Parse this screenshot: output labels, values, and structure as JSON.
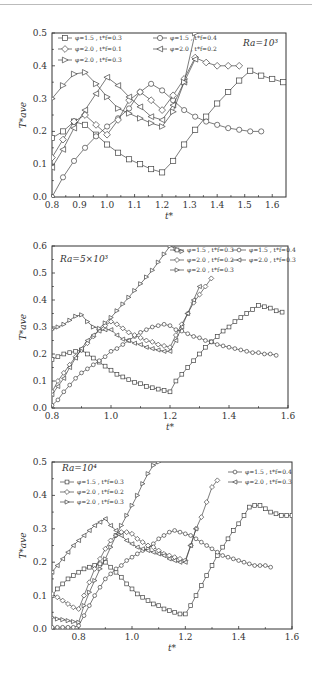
{
  "chart_data": [
    {
      "type": "line",
      "title": "",
      "annotation": "Ra=10³",
      "xlabel": "t*",
      "ylabel": "T*ave",
      "xlim": [
        0.8,
        1.65
      ],
      "ylim": [
        0.0,
        0.5
      ],
      "xticks": [
        0.8,
        0.9,
        1.0,
        1.1,
        1.2,
        1.3,
        1.4,
        1.5,
        1.6
      ],
      "yticks": [
        0.0,
        0.1,
        0.2,
        0.3,
        0.4,
        0.5
      ],
      "legend_position": "upper-left",
      "series": [
        {
          "name": "φ=1.5 , t*f=0.3",
          "marker": "square",
          "x": [
            0.8,
            0.84,
            0.88,
            0.92,
            0.96,
            1.0,
            1.04,
            1.08,
            1.12,
            1.16,
            1.2,
            1.24,
            1.28,
            1.32,
            1.36,
            1.4,
            1.44,
            1.48,
            1.52,
            1.56,
            1.6,
            1.64
          ],
          "y": [
            0.18,
            0.2,
            0.23,
            0.22,
            0.19,
            0.16,
            0.135,
            0.115,
            0.1,
            0.085,
            0.075,
            0.11,
            0.16,
            0.205,
            0.245,
            0.285,
            0.32,
            0.355,
            0.385,
            0.37,
            0.36,
            0.35
          ]
        },
        {
          "name": "φ=1.5 , t*f=0.4",
          "marker": "circle",
          "x": [
            0.8,
            0.84,
            0.88,
            0.92,
            0.96,
            1.0,
            1.04,
            1.08,
            1.12,
            1.16,
            1.2,
            1.24,
            1.28,
            1.32,
            1.36,
            1.4,
            1.44,
            1.48,
            1.52,
            1.56
          ],
          "y": [
            0.0,
            0.06,
            0.11,
            0.15,
            0.185,
            0.215,
            0.24,
            0.27,
            0.32,
            0.345,
            0.325,
            0.295,
            0.265,
            0.245,
            0.23,
            0.22,
            0.21,
            0.205,
            0.2,
            0.2
          ]
        },
        {
          "name": "φ=2.0 , t*f=0.1",
          "marker": "diamond",
          "x": [
            0.8,
            0.84,
            0.88,
            0.92,
            0.96,
            1.0,
            1.04,
            1.08,
            1.12,
            1.16,
            1.2,
            1.24,
            1.28,
            1.32,
            1.36,
            1.4,
            1.44,
            1.48
          ],
          "y": [
            0.12,
            0.175,
            0.23,
            0.25,
            0.22,
            0.19,
            0.235,
            0.295,
            0.32,
            0.295,
            0.265,
            0.31,
            0.36,
            0.425,
            0.41,
            0.4,
            0.4,
            0.4
          ]
        },
        {
          "name": "φ=2.0 , t*f=0.2",
          "marker": "triangle-left",
          "x": [
            0.8,
            0.84,
            0.88,
            0.92,
            0.96,
            1.0,
            1.04,
            1.08,
            1.12,
            1.16,
            1.2,
            1.24,
            1.28,
            1.32
          ],
          "y": [
            0.09,
            0.145,
            0.21,
            0.265,
            0.315,
            0.365,
            0.34,
            0.305,
            0.275,
            0.245,
            0.235,
            0.28,
            0.35,
            0.42
          ]
        },
        {
          "name": "φ=2.0 , t*f=0.3",
          "marker": "triangle-right",
          "x": [
            0.8,
            0.84,
            0.88,
            0.92,
            0.96,
            1.0,
            1.04,
            1.08,
            1.12,
            1.16,
            1.2,
            1.24,
            1.28,
            1.32
          ],
          "y": [
            0.3,
            0.34,
            0.375,
            0.38,
            0.345,
            0.305,
            0.27,
            0.255,
            0.24,
            0.225,
            0.215,
            0.26,
            0.35,
            0.5
          ]
        }
      ]
    },
    {
      "type": "line",
      "title": "",
      "annotation": "Ra=5×10³",
      "xlabel": "t*",
      "ylabel": "T*ave",
      "xlim": [
        0.8,
        1.6
      ],
      "ylim": [
        0.0,
        0.6
      ],
      "xticks": [
        0.8,
        1.0,
        1.2,
        1.4,
        1.6
      ],
      "yticks": [
        0.0,
        0.1,
        0.2,
        0.3,
        0.4,
        0.5,
        0.6
      ],
      "legend_position": "upper-right",
      "series": [
        {
          "name": "φ=1.5 , t*f=0.3",
          "marker": "square",
          "x": [
            0.8,
            0.82,
            0.84,
            0.86,
            0.88,
            0.9,
            0.92,
            0.94,
            0.96,
            0.98,
            1.0,
            1.02,
            1.04,
            1.06,
            1.08,
            1.1,
            1.12,
            1.14,
            1.16,
            1.18,
            1.2,
            1.22,
            1.24,
            1.26,
            1.28,
            1.3,
            1.32,
            1.34,
            1.36,
            1.38,
            1.4,
            1.42,
            1.44,
            1.46,
            1.48,
            1.5,
            1.52,
            1.54,
            1.56,
            1.58
          ],
          "y": [
            0.18,
            0.19,
            0.2,
            0.205,
            0.21,
            0.215,
            0.2,
            0.185,
            0.17,
            0.155,
            0.14,
            0.125,
            0.115,
            0.105,
            0.095,
            0.09,
            0.08,
            0.075,
            0.07,
            0.065,
            0.06,
            0.1,
            0.125,
            0.15,
            0.175,
            0.2,
            0.225,
            0.245,
            0.265,
            0.285,
            0.3,
            0.32,
            0.335,
            0.35,
            0.365,
            0.38,
            0.375,
            0.37,
            0.36,
            0.355
          ]
        },
        {
          "name": "φ=1.5 , t*f=0.4",
          "marker": "circle",
          "x": [
            0.8,
            0.82,
            0.84,
            0.86,
            0.88,
            0.9,
            0.92,
            0.94,
            0.96,
            0.98,
            1.0,
            1.02,
            1.04,
            1.06,
            1.08,
            1.1,
            1.12,
            1.14,
            1.16,
            1.18,
            1.2,
            1.22,
            1.24,
            1.26,
            1.28,
            1.3,
            1.32,
            1.34,
            1.36,
            1.38,
            1.4,
            1.42,
            1.44,
            1.46,
            1.48,
            1.5,
            1.52,
            1.54,
            1.56
          ],
          "y": [
            0.01,
            0.03,
            0.06,
            0.085,
            0.11,
            0.13,
            0.145,
            0.16,
            0.175,
            0.19,
            0.21,
            0.22,
            0.235,
            0.25,
            0.265,
            0.28,
            0.29,
            0.3,
            0.305,
            0.31,
            0.305,
            0.29,
            0.285,
            0.275,
            0.265,
            0.26,
            0.25,
            0.245,
            0.235,
            0.23,
            0.225,
            0.22,
            0.215,
            0.21,
            0.205,
            0.205,
            0.2,
            0.2,
            0.195
          ]
        },
        {
          "name": "φ=2.0 , t*f=0.2",
          "marker": "diamond",
          "x": [
            0.8,
            0.82,
            0.84,
            0.86,
            0.88,
            0.9,
            0.92,
            0.94,
            0.96,
            0.98,
            1.0,
            1.02,
            1.04,
            1.06,
            1.08,
            1.1,
            1.12,
            1.14,
            1.16,
            1.18,
            1.2,
            1.22,
            1.24,
            1.26,
            1.28,
            1.3,
            1.32,
            1.34
          ],
          "y": [
            0.06,
            0.1,
            0.13,
            0.16,
            0.19,
            0.215,
            0.24,
            0.265,
            0.29,
            0.305,
            0.32,
            0.31,
            0.295,
            0.28,
            0.27,
            0.26,
            0.25,
            0.245,
            0.235,
            0.23,
            0.225,
            0.27,
            0.31,
            0.35,
            0.39,
            0.42,
            0.45,
            0.48
          ]
        },
        {
          "name": "φ=2.0 , t*f=0.3",
          "marker": "triangle-left",
          "x": [
            0.8,
            0.82,
            0.84,
            0.86,
            0.88,
            0.9,
            0.92,
            0.94,
            0.96,
            0.98,
            1.0,
            1.02,
            1.04,
            1.06,
            1.08,
            1.1,
            1.12,
            1.14,
            1.16,
            1.18,
            1.2,
            1.22,
            1.24,
            1.26,
            1.28,
            1.3
          ],
          "y": [
            0.05,
            0.08,
            0.11,
            0.15,
            0.185,
            0.22,
            0.25,
            0.27,
            0.285,
            0.29,
            0.29,
            0.27,
            0.255,
            0.25,
            0.24,
            0.235,
            0.225,
            0.22,
            0.215,
            0.21,
            0.21,
            0.25,
            0.3,
            0.35,
            0.4,
            0.45
          ]
        },
        {
          "name": "φ=2.0 , t*f=0.3 (▷)",
          "marker": "triangle-right",
          "x": [
            0.8,
            0.82,
            0.84,
            0.86,
            0.88,
            0.9,
            0.92,
            0.94,
            0.96,
            0.98,
            1.0,
            1.02,
            1.04,
            1.06,
            1.08,
            1.1,
            1.12,
            1.14,
            1.16,
            1.18,
            1.2,
            1.22,
            1.24
          ],
          "y": [
            0.29,
            0.3,
            0.31,
            0.325,
            0.34,
            0.345,
            0.32,
            0.3,
            0.295,
            0.315,
            0.335,
            0.36,
            0.385,
            0.41,
            0.435,
            0.46,
            0.485,
            0.51,
            0.54,
            0.57,
            0.6,
            0.59,
            0.58
          ]
        }
      ]
    },
    {
      "type": "line",
      "title": "",
      "annotation": "Ra=10⁴",
      "xlabel": "t*",
      "ylabel": "T*ave",
      "xlim": [
        0.7,
        1.6
      ],
      "ylim": [
        0.0,
        0.5
      ],
      "xticks": [
        0.8,
        1.0,
        1.2,
        1.4,
        1.6
      ],
      "yticks": [
        0.0,
        0.1,
        0.2,
        0.3,
        0.4,
        0.5
      ],
      "legend_position": "upper-left / upper-right split",
      "series": [
        {
          "name": "φ=1.5 , t*f=0.3",
          "marker": "square",
          "x": [
            0.7,
            0.72,
            0.74,
            0.76,
            0.78,
            0.8,
            0.82,
            0.84,
            0.86,
            0.88,
            0.9,
            0.92,
            0.94,
            0.96,
            0.98,
            1.0,
            1.02,
            1.04,
            1.06,
            1.08,
            1.1,
            1.12,
            1.14,
            1.16,
            1.18,
            1.2,
            1.22,
            1.24,
            1.26,
            1.28,
            1.3,
            1.32,
            1.34,
            1.36,
            1.38,
            1.4,
            1.42,
            1.44,
            1.46,
            1.48,
            1.5,
            1.52,
            1.54,
            1.56,
            1.58,
            1.6
          ],
          "y": [
            0.1,
            0.12,
            0.135,
            0.15,
            0.16,
            0.17,
            0.18,
            0.185,
            0.19,
            0.195,
            0.2,
            0.185,
            0.17,
            0.155,
            0.135,
            0.12,
            0.105,
            0.095,
            0.085,
            0.075,
            0.07,
            0.06,
            0.055,
            0.05,
            0.045,
            0.045,
            0.07,
            0.1,
            0.13,
            0.16,
            0.19,
            0.22,
            0.245,
            0.27,
            0.295,
            0.315,
            0.34,
            0.365,
            0.37,
            0.37,
            0.36,
            0.35,
            0.345,
            0.34,
            0.34,
            0.34
          ]
        },
        {
          "name": "φ=1.5 , t*f=0.4",
          "marker": "circle",
          "x": [
            0.7,
            0.72,
            0.74,
            0.76,
            0.78,
            0.8,
            0.82,
            0.84,
            0.86,
            0.88,
            0.9,
            0.92,
            0.94,
            0.96,
            0.98,
            1.0,
            1.02,
            1.04,
            1.06,
            1.08,
            1.1,
            1.12,
            1.14,
            1.16,
            1.18,
            1.2,
            1.22,
            1.24,
            1.26,
            1.28,
            1.3,
            1.32,
            1.34,
            1.36,
            1.38,
            1.4,
            1.42,
            1.44,
            1.46,
            1.48,
            1.5,
            1.52
          ],
          "y": [
            0.005,
            0.005,
            0.005,
            0.005,
            0.005,
            0.01,
            0.04,
            0.07,
            0.1,
            0.125,
            0.15,
            0.165,
            0.18,
            0.19,
            0.205,
            0.215,
            0.225,
            0.235,
            0.24,
            0.255,
            0.27,
            0.28,
            0.29,
            0.295,
            0.29,
            0.285,
            0.28,
            0.27,
            0.26,
            0.25,
            0.24,
            0.23,
            0.22,
            0.215,
            0.21,
            0.205,
            0.2,
            0.195,
            0.19,
            0.19,
            0.19,
            0.185
          ]
        },
        {
          "name": "φ=2.0 , t*f=0.2",
          "marker": "diamond",
          "x": [
            0.7,
            0.72,
            0.74,
            0.76,
            0.78,
            0.8,
            0.82,
            0.84,
            0.86,
            0.88,
            0.9,
            0.92,
            0.94,
            0.96,
            0.98,
            1.0,
            1.02,
            1.04,
            1.06,
            1.08,
            1.1,
            1.12,
            1.14,
            1.16,
            1.18,
            1.2,
            1.22,
            1.24,
            1.26,
            1.28,
            1.3,
            1.32
          ],
          "y": [
            0.105,
            0.095,
            0.085,
            0.075,
            0.065,
            0.06,
            0.1,
            0.14,
            0.18,
            0.21,
            0.24,
            0.265,
            0.28,
            0.29,
            0.29,
            0.285,
            0.27,
            0.26,
            0.25,
            0.245,
            0.235,
            0.225,
            0.22,
            0.215,
            0.21,
            0.205,
            0.25,
            0.3,
            0.335,
            0.38,
            0.425,
            0.445
          ]
        },
        {
          "name": "φ=2.0 , t*f=0.3",
          "marker": "triangle-left",
          "x": [
            0.7,
            0.72,
            0.74,
            0.76,
            0.78,
            0.8,
            0.82,
            0.84,
            0.86,
            0.88,
            0.9,
            0.92,
            0.94,
            0.96,
            0.98,
            1.0,
            1.02,
            1.04,
            1.06,
            1.08,
            1.1,
            1.12,
            1.14,
            1.16,
            1.18,
            1.2,
            1.22,
            1.24
          ],
          "y": [
            0.17,
            0.19,
            0.21,
            0.23,
            0.25,
            0.265,
            0.28,
            0.295,
            0.31,
            0.32,
            0.33,
            0.31,
            0.295,
            0.28,
            0.265,
            0.255,
            0.245,
            0.24,
            0.235,
            0.23,
            0.225,
            0.22,
            0.21,
            0.205,
            0.2,
            0.2,
            0.25,
            0.3
          ]
        },
        {
          "name": "φ=2.0 , t*f=0.3 (▷)",
          "marker": "triangle-right",
          "x": [
            0.7,
            0.72,
            0.74,
            0.76,
            0.78,
            0.8,
            0.82,
            0.84,
            0.86,
            0.88,
            0.9,
            0.92,
            0.94,
            0.96,
            0.98,
            1.0,
            1.02,
            1.04,
            1.06,
            1.08,
            1.1
          ],
          "y": [
            0.035,
            0.03,
            0.028,
            0.025,
            0.022,
            0.02,
            0.07,
            0.11,
            0.145,
            0.18,
            0.21,
            0.245,
            0.28,
            0.31,
            0.34,
            0.37,
            0.4,
            0.435,
            0.465,
            0.49,
            0.5
          ]
        }
      ]
    }
  ],
  "charts": [
    {
      "annotation": "Ra=10³",
      "x_title": "t*",
      "y_title": "T*ave",
      "legend": [
        "φ=1.5 , t*f=0.3",
        "φ=1.5 , t*f=0.4",
        "φ=2.0 , t*f=0.1",
        "φ=2.0 , t*f=0.2",
        "φ=2.0 , t*f=0.3"
      ]
    },
    {
      "annotation": "Ra=5×10³",
      "x_title": "t*",
      "y_title": "T*ave",
      "legend": [
        "φ=1.5 , t*f=0.3",
        "φ=1.5 , t*f=0.4",
        "φ=2.0 , t*f=0.2",
        "φ=2.0 , t*f=0.3",
        "φ=2.0 , t*f=0.3"
      ]
    },
    {
      "annotation": "Ra=10⁴",
      "x_title": "t*",
      "y_title": "T*ave",
      "legend": [
        "φ=1.5 , t*f=0.3",
        "φ=1.5 , t*f=0.4",
        "φ=2.0 , t*f=0.2",
        "φ=2.0 , t*f=0.3",
        "φ=2.0 , t*f=0.3"
      ]
    }
  ]
}
